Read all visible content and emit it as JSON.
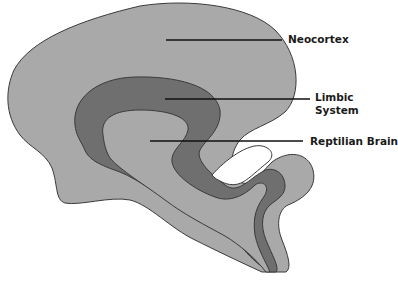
{
  "diagram": {
    "type": "brain-region-illustration",
    "colors": {
      "outer_region": "#a9a9a9",
      "middle_region": "#6f6f6f",
      "outline": "#3a3a3a",
      "pointer_line": "#111111",
      "background": "#ffffff"
    },
    "labels": [
      {
        "id": "neocortex",
        "text": "Neocortex"
      },
      {
        "id": "limbic",
        "line1": "Limbic",
        "line2": "System"
      },
      {
        "id": "reptilian",
        "text": "Reptilian Brain"
      }
    ]
  }
}
